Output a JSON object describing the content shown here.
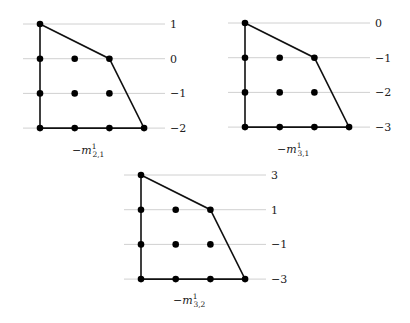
{
  "chart_data": [
    {
      "type": "scatter",
      "name": "polygon-m21",
      "caption": {
        "prefix": "−m",
        "sup": "1",
        "sub": "2,1"
      },
      "row_labels": [
        "1",
        "0",
        "−1",
        "−2"
      ],
      "lattice_points": [
        [
          0,
          0
        ],
        [
          0,
          1
        ],
        [
          0,
          2
        ],
        [
          0,
          3
        ],
        [
          1,
          1
        ],
        [
          1,
          2
        ],
        [
          1,
          3
        ],
        [
          2,
          1
        ],
        [
          2,
          2
        ],
        [
          2,
          3
        ],
        [
          3,
          3
        ]
      ],
      "polygon_vertices": [
        [
          0,
          0
        ],
        [
          2,
          1
        ],
        [
          3,
          3
        ],
        [
          0,
          3
        ]
      ]
    },
    {
      "type": "scatter",
      "name": "polygon-m31",
      "caption": {
        "prefix": "−m",
        "sup": "1",
        "sub": "3,1"
      },
      "row_labels": [
        "0",
        "−1",
        "−2",
        "−3"
      ],
      "lattice_points": [
        [
          0,
          0
        ],
        [
          0,
          1
        ],
        [
          0,
          2
        ],
        [
          0,
          3
        ],
        [
          1,
          1
        ],
        [
          1,
          2
        ],
        [
          1,
          3
        ],
        [
          2,
          1
        ],
        [
          2,
          2
        ],
        [
          2,
          3
        ],
        [
          3,
          3
        ]
      ],
      "polygon_vertices": [
        [
          0,
          0
        ],
        [
          2,
          1
        ],
        [
          3,
          3
        ],
        [
          0,
          3
        ]
      ]
    },
    {
      "type": "scatter",
      "name": "polygon-m32",
      "caption": {
        "prefix": "−m",
        "sup": "1",
        "sub": "3,2"
      },
      "row_labels": [
        "3",
        "1",
        "−1",
        "−3"
      ],
      "lattice_points": [
        [
          0,
          0
        ],
        [
          0,
          1
        ],
        [
          0,
          2
        ],
        [
          0,
          3
        ],
        [
          1,
          1
        ],
        [
          1,
          2
        ],
        [
          1,
          3
        ],
        [
          2,
          1
        ],
        [
          2,
          2
        ],
        [
          2,
          3
        ],
        [
          3,
          3
        ]
      ],
      "polygon_vertices": [
        [
          0,
          0
        ],
        [
          2,
          1
        ],
        [
          3,
          3
        ],
        [
          0,
          3
        ]
      ]
    }
  ]
}
